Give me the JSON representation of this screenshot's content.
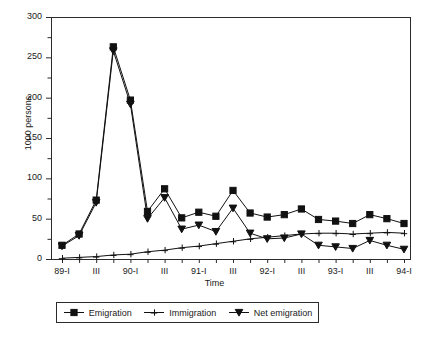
{
  "chart_data": {
    "type": "line",
    "title": "",
    "xlabel": "Time",
    "ylabel": "1000 persons",
    "ylim": [
      0,
      300
    ],
    "ytick_values": [
      0,
      50,
      100,
      150,
      200,
      250,
      300
    ],
    "ytick_labels": [
      "0",
      "50",
      "100",
      "150",
      "200",
      "250",
      "300"
    ],
    "yminor_step": 25,
    "grid": false,
    "legend_position": "below-axes",
    "x": [
      "89-I",
      "89-II",
      "89-III",
      "89-IV",
      "90-I",
      "90-II",
      "90-III",
      "90-IV",
      "91-I",
      "91-II",
      "91-III",
      "91-IV",
      "92-I",
      "92-II",
      "92-III",
      "92-IV",
      "93-I",
      "93-II",
      "93-III",
      "93-IV",
      "94-I"
    ],
    "xtick_labels": [
      "89-I",
      "",
      "III",
      "",
      "90-I",
      "",
      "III",
      "",
      "91-I",
      "",
      "III",
      "",
      "92-I",
      "",
      "III",
      "",
      "93-I",
      "",
      "III",
      "",
      "94-I"
    ],
    "categories": [
      "89-I",
      "89-II",
      "89-III",
      "89-IV",
      "90-I",
      "90-II",
      "90-III",
      "90-IV",
      "91-I",
      "91-II",
      "91-III",
      "91-IV",
      "92-I",
      "92-II",
      "92-III",
      "92-IV",
      "93-I",
      "93-II",
      "93-III",
      "93-IV",
      "94-I"
    ],
    "series": [
      {
        "name": "Emigration",
        "marker": "filled-square",
        "values": [
          17,
          31,
          73,
          263,
          197,
          59,
          87,
          51,
          58,
          53,
          85,
          57,
          52,
          55,
          62,
          49,
          47,
          44,
          55,
          50,
          44
        ]
      },
      {
        "name": "Immigration",
        "marker": "plus",
        "values": [
          1,
          2,
          3,
          5,
          6,
          9,
          11,
          14,
          16,
          19,
          22,
          25,
          27,
          29,
          31,
          32,
          32,
          31,
          32,
          33,
          32
        ]
      },
      {
        "name": "Net emigration",
        "marker": "filled-triangle-down",
        "values": [
          16,
          29,
          70,
          258,
          192,
          50,
          76,
          37,
          42,
          34,
          63,
          32,
          25,
          26,
          31,
          17,
          15,
          13,
          23,
          17,
          12
        ]
      }
    ]
  },
  "legend": {
    "entries": [
      {
        "label": "Emigration",
        "glyph": "filled-square-marker"
      },
      {
        "label": "Immigration",
        "glyph": "plus-marker"
      },
      {
        "label": "Net emigration",
        "glyph": "filled-triangle-down-marker"
      }
    ]
  },
  "colors": {
    "axis": "#2b2b2b",
    "series": "#1a1a1a",
    "background": "#ffffff"
  }
}
